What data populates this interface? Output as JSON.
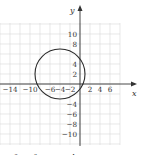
{
  "chart_data": {
    "type": "line",
    "title": "",
    "curve": {
      "kind": "circle",
      "center": [
        -4,
        2
      ],
      "radius": 5,
      "color": "#2a2a2a"
    },
    "xlabel": "x",
    "ylabel": "y",
    "xlim": [
      -16,
      11
    ],
    "ylim": [
      -12,
      12
    ],
    "grid": true,
    "x_tick_labels": [
      "-14",
      "-10",
      "-6",
      "-4",
      "-2",
      "2",
      "4",
      "6"
    ],
    "x_tick_values": [
      -14,
      -10,
      -6,
      -4,
      -2,
      2,
      4,
      6
    ],
    "y_tick_labels": [
      "10",
      "8",
      "4",
      "2",
      "-4",
      "-6",
      "-8",
      "-10"
    ],
    "y_tick_values": [
      10,
      8,
      4,
      2,
      -4,
      -6,
      -8,
      -10
    ],
    "legend": null,
    "caption_partial": "x² + y² + 8x − 4y − 5 = 0"
  },
  "labels": {
    "x_axis": "x",
    "y_axis": "y",
    "caption_visible": "2    2    8    4    10    8"
  }
}
